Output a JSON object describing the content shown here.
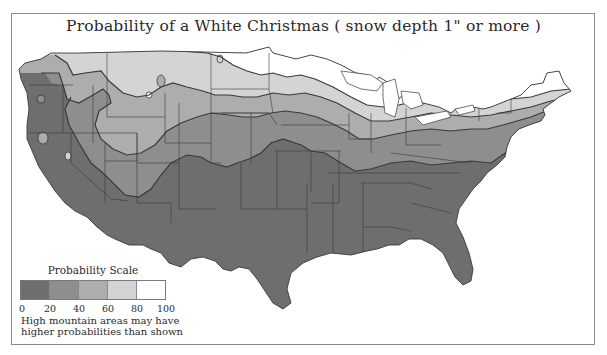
{
  "map": {
    "title": "Probability of a White Christmas ( snow depth 1\" or more )",
    "region": "Contiguous United States",
    "band_colors": {
      "0-20": "#6e6e6e",
      "20-40": "#8e8e8e",
      "40-60": "#adadad",
      "60-80": "#d2d2d2",
      "80-100": "#ffffff"
    },
    "state_line_color": "#3a3a3a",
    "frame_color": "#8a8a8a"
  },
  "legend": {
    "title": "Probability Scale",
    "swatches": [
      {
        "range": "0-20",
        "color": "#6e6e6e"
      },
      {
        "range": "20-40",
        "color": "#8e8e8e"
      },
      {
        "range": "40-60",
        "color": "#adadad"
      },
      {
        "range": "60-80",
        "color": "#d4d4d4"
      },
      {
        "range": "80-100",
        "color": "#ffffff"
      }
    ],
    "ticks": [
      "0",
      "20",
      "40",
      "60",
      "80",
      "100"
    ],
    "note_line1": "High mountain areas may have",
    "note_line2": "higher probabilities than shown"
  }
}
